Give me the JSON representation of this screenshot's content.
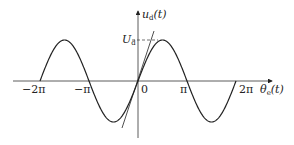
{
  "diagram": {
    "type": "sine-waveform",
    "y_axis_label": "u_d(t)",
    "y_axis_label_main": "u",
    "y_axis_label_sub": "d",
    "y_axis_label_arg": "(t)",
    "x_axis_label_main": "θ",
    "x_axis_label_sub": "e",
    "x_axis_label_arg": "(t)",
    "amplitude_label_main": "U",
    "amplitude_label_sub": "d",
    "origin_label": "0",
    "x_ticks": [
      {
        "value": -2,
        "label": "−2π"
      },
      {
        "value": -1,
        "label": "−π"
      },
      {
        "value": 1,
        "label": "π"
      },
      {
        "value": 2,
        "label": "2π"
      }
    ],
    "x_range_pi": [
      -2,
      2
    ],
    "function": "U_d·sin(θ_e)",
    "tangent_at_origin": true,
    "line_color": "#222222"
  }
}
